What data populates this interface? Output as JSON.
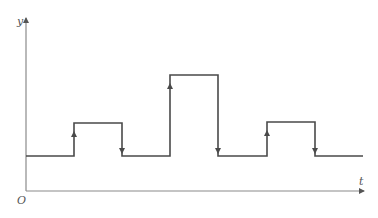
{
  "figure": {
    "top_text_cut": "",
    "axes": {
      "y_label": "y",
      "x_label": "t",
      "origin_label": "O",
      "origin": [
        26,
        191
      ],
      "y_axis_top": 18,
      "x_axis_right": 364,
      "axis_color": "#8a8a8a"
    },
    "waveform": {
      "line_color": "#4a4a4a",
      "baseline_y": 156,
      "x_start": 26,
      "x_end": 363,
      "pulses": [
        {
          "rise_x": 74,
          "fall_x": 122,
          "top_y": 123
        },
        {
          "rise_x": 170,
          "fall_x": 218,
          "top_y": 75
        },
        {
          "rise_x": 267,
          "fall_x": 315,
          "top_y": 122
        }
      ]
    }
  }
}
